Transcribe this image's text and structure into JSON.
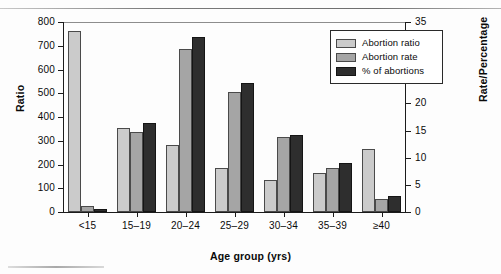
{
  "chart_data": {
    "type": "bar",
    "title": "",
    "xlabel": "Age group (yrs)",
    "ylabel": "Ratio",
    "ylabel_right": "Rate/Percentage",
    "categories": [
      "<15",
      "15–19",
      "20–24",
      "25–29",
      "30–34",
      "35–39",
      "≥40"
    ],
    "ylim": [
      0,
      800
    ],
    "yticks": [
      0,
      100,
      200,
      300,
      400,
      500,
      600,
      700,
      800
    ],
    "ylim_right": [
      0,
      35
    ],
    "yticks_right": [
      0,
      5,
      10,
      15,
      20,
      25,
      30,
      35
    ],
    "grid": false,
    "legend_position": "top-right",
    "series": [
      {
        "name": "Abortion ratio",
        "axis": "left",
        "color": "#cbcbcb",
        "values": [
          763,
          355,
          281,
          186,
          133,
          165,
          267
        ]
      },
      {
        "name": "Abortion rate",
        "axis": "right",
        "color": "#a5a5a5",
        "values": [
          1.2,
          14.7,
          30.1,
          22.1,
          13.8,
          8.2,
          2.4
        ]
      },
      {
        "name": "% of abortions",
        "axis": "right",
        "color": "#2e2e2e",
        "values": [
          0.5,
          16.4,
          32.2,
          23.7,
          14.2,
          9.1,
          3.0
        ]
      }
    ]
  },
  "axes": {
    "left": {
      "title": "Ratio",
      "ticks": [
        "800",
        "700",
        "600",
        "500",
        "400",
        "300",
        "200",
        "100",
        "0"
      ]
    },
    "right": {
      "title": "Rate/Percentage",
      "ticks": [
        "35",
        "30",
        "25",
        "20",
        "15",
        "10",
        "5",
        "0"
      ]
    },
    "bottom": {
      "title": "Age group (yrs)",
      "ticks": [
        "<15",
        "15–19",
        "20–24",
        "25–29",
        "30–34",
        "35–39",
        "≥40"
      ]
    }
  },
  "legend": {
    "items": [
      {
        "label": "Abortion ratio",
        "color": "#cbcbcb"
      },
      {
        "label": "Abortion rate",
        "color": "#a5a5a5"
      },
      {
        "label": "% of abortions",
        "color": "#2e2e2e"
      }
    ]
  }
}
